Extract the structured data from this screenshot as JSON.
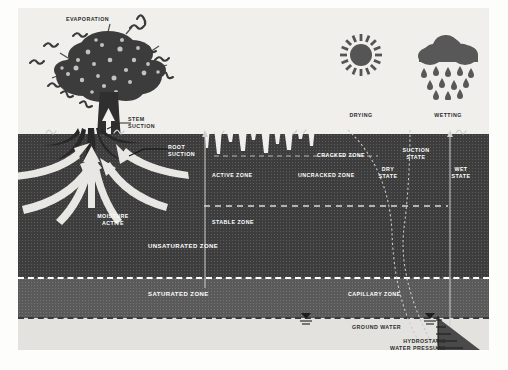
{
  "figure": {
    "colors": {
      "sky": "#f0efec",
      "unsaturated_soil": "#3d3d3d",
      "saturated_soil": "#5a5a5a",
      "ground_water": "#e3e2de",
      "label_text": "#ffffff",
      "dark_label_text": "#2c2c2c",
      "arrow_fill": "#e8e7e3",
      "hydrostatic_triangle": "#4a4a4a"
    }
  },
  "sky_labels": {
    "evaporation": "EVAPORATION",
    "drying": "DRYING",
    "wetting": "WETTING"
  },
  "tree_labels": {
    "stem_suction": "STEM\nSUCTION",
    "root_suction": "ROOT\nSUCTION",
    "moisture_active": "MOISTURE\nACTIVE"
  },
  "soil_labels": {
    "cracked_zone": "CRACKED ZONE",
    "uncracked_zone": "UNCRACKED ZONE",
    "active_zone": "ACTIVE ZONE",
    "stable_zone": "STABLE ZONE",
    "unsaturated_zone": "UNSATURATED ZONE",
    "saturated_zone": "SATURATED ZONE",
    "capillary_zone": "CAPILLARY ZONE",
    "ground_water": "GROUND WATER"
  },
  "state_labels": {
    "suction_state": "SUCTION\nSTATE",
    "dry_state": "DRY\nSTATE",
    "wet_state": "WET\nSTATE",
    "hydrostatic_water_pressure": "HYDROSTATIC\nWATER PRESSURE"
  },
  "icons": {
    "sun": "sun-icon",
    "cloud": "rain-cloud-icon",
    "raindrop": "raindrop-icon",
    "tree": "tree-icon",
    "water_table": "water-table-symbol",
    "evaporation_squiggle": "evaporation-squiggle-icon",
    "grass_tuft": "grass-tuft-icon"
  }
}
